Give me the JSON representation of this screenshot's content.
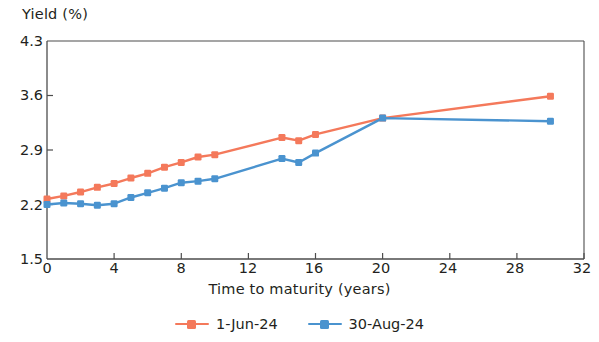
{
  "chart_data": {
    "type": "line",
    "title": "",
    "xlabel": "Time to maturity (years)",
    "ylabel": "Yield (%)",
    "xlim": [
      0,
      32
    ],
    "ylim": [
      1.5,
      4.3
    ],
    "xticks": [
      0,
      4,
      8,
      12,
      16,
      20,
      24,
      28,
      32
    ],
    "yticks": [
      1.5,
      2.2,
      2.9,
      3.6,
      4.3
    ],
    "grid": false,
    "legend_position": "bottom-center",
    "markers": "square",
    "series": [
      {
        "name": "1-Jun-24",
        "color": "#F4795B",
        "x": [
          0,
          1,
          2,
          3,
          4,
          5,
          6,
          7,
          8,
          9,
          10,
          14,
          15,
          16,
          20,
          30
        ],
        "values": [
          2.27,
          2.31,
          2.36,
          2.42,
          2.47,
          2.54,
          2.6,
          2.68,
          2.74,
          2.81,
          2.84,
          3.06,
          3.02,
          3.1,
          3.31,
          3.59
        ]
      },
      {
        "name": "30-Aug-24",
        "color": "#4A93CF",
        "x": [
          0,
          1,
          2,
          3,
          4,
          5,
          6,
          7,
          8,
          9,
          10,
          14,
          15,
          16,
          20,
          30
        ],
        "values": [
          2.2,
          2.22,
          2.21,
          2.19,
          2.21,
          2.29,
          2.35,
          2.41,
          2.48,
          2.5,
          2.53,
          2.79,
          2.74,
          2.86,
          3.31,
          3.27
        ]
      }
    ]
  },
  "legend": {
    "items": [
      {
        "label": "1-Jun-24",
        "color": "#F4795B"
      },
      {
        "label": "30-Aug-24",
        "color": "#4A93CF"
      }
    ]
  },
  "axes": {
    "y_title": "Yield (%)",
    "x_title": "Time to maturity (years)",
    "y_tick_labels": [
      "4.3",
      "3.6",
      "2.9",
      "2.2",
      "1.5"
    ],
    "x_tick_labels": [
      "0",
      "4",
      "8",
      "12",
      "16",
      "20",
      "24",
      "28",
      "32"
    ]
  }
}
